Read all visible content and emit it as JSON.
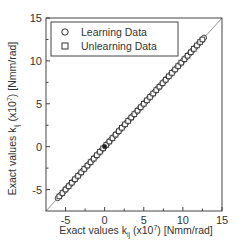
{
  "chart_data": {
    "type": "scatter",
    "title": "",
    "xlabel": {
      "prefix": "Exact values k",
      "subscript": "ij",
      "mid": " (x10",
      "superscript": "7",
      "suffix": ") [Nmm/rad]"
    },
    "ylabel": {
      "prefix": "Exact values k",
      "subscript": "ij",
      "mid": " (x10",
      "superscript": "7",
      "suffix": ") [Nmm/rad]"
    },
    "xlim": [
      -7.5,
      15
    ],
    "ylim": [
      -7.5,
      15
    ],
    "xticks": [
      -5,
      0,
      5,
      10,
      15
    ],
    "yticks": [
      -5,
      0,
      5,
      10,
      15
    ],
    "xtick_labels": [
      "-5",
      "0",
      "5",
      "10",
      "15"
    ],
    "ytick_labels": [
      "-5",
      "0",
      "5",
      "10",
      "15"
    ],
    "minor_ticks": [
      -2.5,
      2.5,
      7.5,
      12.5
    ],
    "grid": false,
    "legend": {
      "position": "top-left",
      "entries": [
        {
          "name": "Learning Data",
          "marker": "circle"
        },
        {
          "name": "Unlearning Data",
          "marker": "square"
        }
      ]
    },
    "reference_line": {
      "type": "y=x",
      "from": -7.5,
      "to": 15
    },
    "series": [
      {
        "name": "Learning Data",
        "marker": "circle",
        "range": [
          -6.0,
          12.7
        ],
        "x": [
          -6.0,
          -5.6,
          -5.2,
          -4.8,
          -4.4,
          -4.0,
          -3.6,
          -3.2,
          -2.8,
          -2.4,
          -2.0,
          -1.6,
          -1.2,
          -0.8,
          -0.4,
          0.0,
          0.4,
          0.8,
          1.2,
          1.6,
          2.0,
          2.4,
          2.8,
          3.2,
          3.6,
          4.0,
          4.4,
          4.8,
          5.2,
          5.6,
          6.0,
          6.4,
          6.8,
          7.2,
          7.6,
          8.0,
          8.4,
          8.8,
          9.2,
          9.6,
          10.0,
          10.4,
          10.8,
          11.2,
          11.6,
          12.0,
          12.4,
          12.7
        ],
        "y": [
          -6.0,
          -5.6,
          -5.2,
          -4.8,
          -4.4,
          -4.0,
          -3.6,
          -3.2,
          -2.8,
          -2.4,
          -2.0,
          -1.6,
          -1.2,
          -0.8,
          -0.4,
          0.0,
          0.4,
          0.8,
          1.2,
          1.6,
          2.0,
          2.4,
          2.8,
          3.2,
          3.6,
          4.0,
          4.4,
          4.8,
          5.2,
          5.6,
          6.0,
          6.4,
          6.8,
          7.2,
          7.6,
          8.0,
          8.4,
          8.8,
          9.2,
          9.6,
          10.0,
          10.4,
          10.8,
          11.2,
          11.6,
          12.0,
          12.4,
          12.7
        ]
      },
      {
        "name": "Unlearning Data",
        "marker": "square",
        "range": [
          -5.8,
          12.5
        ],
        "x": [
          -5.8,
          -5.4,
          -5.0,
          -4.6,
          -4.2,
          -3.8,
          -3.4,
          -3.0,
          -2.6,
          -2.2,
          -1.8,
          -1.4,
          -1.0,
          -0.6,
          -0.2,
          0.2,
          0.6,
          1.0,
          1.4,
          1.8,
          2.2,
          2.6,
          3.0,
          3.4,
          3.8,
          4.2,
          4.6,
          5.0,
          5.4,
          5.8,
          6.2,
          6.6,
          7.0,
          7.4,
          7.8,
          8.2,
          8.6,
          9.0,
          9.4,
          9.8,
          10.2,
          10.6,
          11.0,
          11.4,
          11.8,
          12.2,
          12.5
        ],
        "y": [
          -5.8,
          -5.4,
          -5.0,
          -4.6,
          -4.2,
          -3.8,
          -3.4,
          -3.0,
          -2.6,
          -2.2,
          -1.8,
          -1.4,
          -1.0,
          -0.6,
          -0.2,
          0.2,
          0.6,
          1.0,
          1.4,
          1.8,
          2.2,
          2.6,
          3.0,
          3.4,
          3.8,
          4.2,
          4.6,
          5.0,
          5.4,
          5.8,
          6.2,
          6.6,
          7.0,
          7.4,
          7.8,
          8.2,
          8.6,
          9.0,
          9.4,
          9.8,
          10.2,
          10.6,
          11.0,
          11.4,
          11.8,
          12.2,
          12.5
        ]
      }
    ]
  },
  "colors": {
    "axis": "#444444",
    "text": "#333333",
    "marker_stroke": "#333333",
    "marker_fill": "#ffffff",
    "reference_line": "#888888",
    "background": "#ffffff"
  }
}
